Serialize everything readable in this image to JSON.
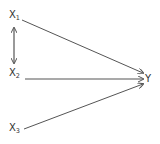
{
  "diagram": {
    "type": "path-diagram",
    "nodes": [
      {
        "id": "x1",
        "label": "X",
        "sub": "1"
      },
      {
        "id": "x2",
        "label": "X",
        "sub": "2"
      },
      {
        "id": "x3",
        "label": "X",
        "sub": "3"
      },
      {
        "id": "y",
        "label": "Y",
        "sub": ""
      }
    ],
    "edges": [
      {
        "from": "x1",
        "to": "y",
        "kind": "directed"
      },
      {
        "from": "x2",
        "to": "y",
        "kind": "directed"
      },
      {
        "from": "x3",
        "to": "y",
        "kind": "directed"
      },
      {
        "from": "x1",
        "to": "x2",
        "kind": "bidirectional"
      }
    ],
    "colors": {
      "line": "#555555",
      "text": "#333333",
      "background": "#ffffff"
    }
  }
}
